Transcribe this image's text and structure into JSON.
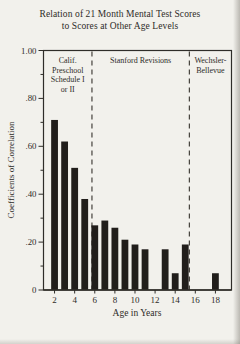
{
  "title": {
    "line1": "Relation of 21 Month Mental Test Scores",
    "line2": "to Scores at Other Age Levels"
  },
  "chart_data": {
    "type": "bar",
    "title": "Relation of 21 Month Mental Test Scores to Scores at Other Age Levels",
    "xlabel": "Age in Years",
    "ylabel": "Coefficients of Correlation",
    "x": [
      2,
      3,
      4,
      5,
      6,
      7,
      8,
      9,
      10,
      11,
      13,
      14,
      15,
      18
    ],
    "values": [
      0.71,
      0.62,
      0.51,
      0.38,
      0.27,
      0.29,
      0.26,
      0.21,
      0.19,
      0.17,
      0.17,
      0.07,
      0.19,
      0.07
    ],
    "xlim": [
      0.9,
      19.6
    ],
    "ylim": [
      0,
      1.0
    ],
    "x_ticks": [
      2,
      4,
      6,
      8,
      10,
      12,
      14,
      16,
      18
    ],
    "y_ticks": [
      {
        "v": 0,
        "label": "0"
      },
      {
        "v": 0.2,
        "label": ".20"
      },
      {
        "v": 0.4,
        "label": ".40"
      },
      {
        "v": 0.6,
        "label": ".60"
      },
      {
        "v": 0.8,
        "label": ".80"
      },
      {
        "v": 1.0,
        "label": "1.00"
      }
    ],
    "y_minor_step": 0.1,
    "dividers": [
      5.72,
      15.41
    ],
    "regions": [
      {
        "label": "Calif. Preschool Schedule I or II",
        "lines": [
          "Calif.",
          "Preschool",
          "Schedule I",
          "or II"
        ]
      },
      {
        "label": "Stanford Revisions",
        "lines": [
          "Stanford Revisions"
        ]
      },
      {
        "label": "Wechsler-Bellevue",
        "lines": [
          "Wechsler-",
          "Bellevue"
        ]
      }
    ],
    "grid": false,
    "legend": false
  },
  "colors": {
    "background": "#f2f1ec",
    "bar": "#211e1b",
    "frame": "#2f2d29",
    "divider": "#45423c",
    "text": "#2e2c28"
  }
}
